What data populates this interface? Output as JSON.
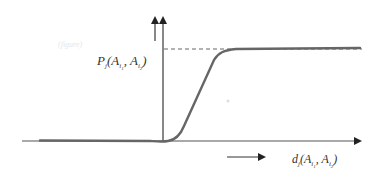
{
  "figure": {
    "type": "sigmoid-threshold-diagram",
    "y_axis_label": {
      "main": "P",
      "sub": "j",
      "args": [
        "A",
        "A"
      ],
      "arg_subs": [
        "i",
        "i"
      ],
      "arg_sub2": [
        "1",
        "2"
      ],
      "text": "P_j(A_{i1}, A_{i2})"
    },
    "x_axis_label": {
      "main": "d",
      "sub": "j",
      "args": [
        "A",
        "A"
      ],
      "arg_subs": [
        "i",
        "i"
      ],
      "arg_sub2": [
        "1",
        "2"
      ],
      "text": "d_j(A_{i1}, A_{i2})"
    },
    "watermark": "(figure)",
    "colors": {
      "axis": "#555555",
      "curve": "#666666",
      "dashed": "#555555",
      "text": "#333333"
    }
  }
}
